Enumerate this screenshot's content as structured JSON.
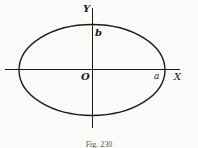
{
  "figure": {
    "type": "ellipse-diagram",
    "axes": {
      "x_label": "X",
      "y_label": "Y",
      "origin_label": "O"
    },
    "ellipse": {
      "semi_major_label": "a",
      "semi_minor_label": "b"
    },
    "caption": "Fig. 230",
    "colors": {
      "stroke": "#1a1a1a",
      "background": "#fbfbfa"
    }
  }
}
